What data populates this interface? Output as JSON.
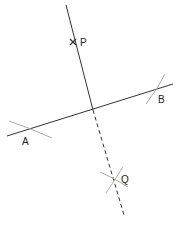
{
  "diagram": {
    "type": "geometric-construction",
    "colors": {
      "line": "#333333",
      "arc": "#aaaaaa",
      "text": "#222222"
    },
    "points": {
      "P": {
        "label": "P",
        "x": 73,
        "y": 42
      },
      "A": {
        "label": "A",
        "x": 28,
        "y": 130
      },
      "B": {
        "label": "B",
        "x": 156,
        "y": 91
      },
      "Q": {
        "label": "Q",
        "x": 113,
        "y": 180
      },
      "foot": {
        "x": 93,
        "y": 110
      }
    },
    "labels": {
      "P": "P",
      "A": "A",
      "B": "B",
      "Q": "Q"
    }
  }
}
